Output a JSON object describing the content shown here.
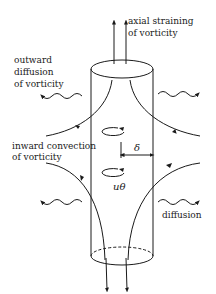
{
  "diagram": {
    "labels": {
      "axial_straining": [
        "axial straining",
        "of vorticity"
      ],
      "outward_diffusion": [
        "outward",
        "diffusion",
        "of vorticity"
      ],
      "inward_convection": [
        "inward convection",
        "of vorticity"
      ],
      "diffusion": "diffusion",
      "delta": "δ",
      "u_theta": "uθ"
    },
    "colors": {
      "stroke": "#1a1a1a",
      "background": "#ffffff"
    }
  }
}
